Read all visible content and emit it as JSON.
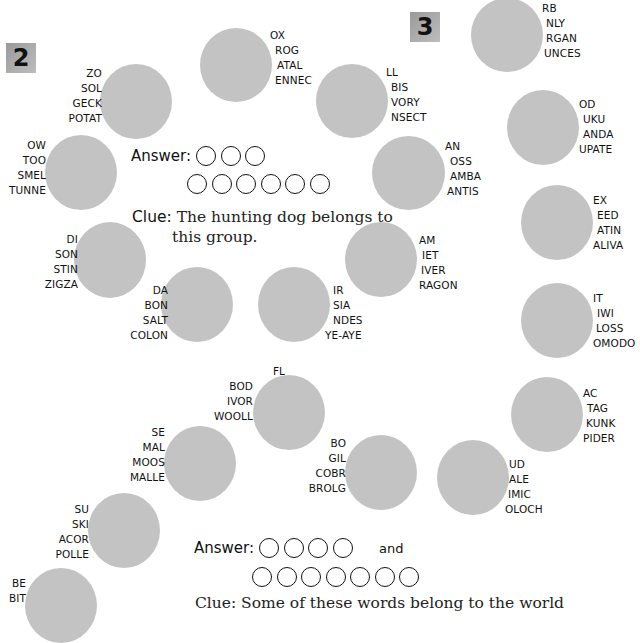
{
  "puzzles": [
    {
      "number": "2",
      "answer_label": "Answer:",
      "answer_rows": [
        3,
        6
      ],
      "clue_label": "Clue:",
      "clue_text_line1": "The hunting dog belongs to",
      "clue_text_line2": "this group.",
      "discs": [
        {
          "id": "ox",
          "words": [
            "OX",
            "ROG",
            "ATAL",
            "ENNEC"
          ],
          "side": "right"
        },
        {
          "id": "ll",
          "words": [
            "LL",
            "BIS",
            "VORY",
            "NSECT"
          ],
          "side": "right"
        },
        {
          "id": "zo",
          "words": [
            "ZO",
            "SOL",
            "GECK",
            "POTAT"
          ],
          "side": "left"
        },
        {
          "id": "ow",
          "words": [
            "OW",
            "TOO",
            "SMEL",
            "TUNNE"
          ],
          "side": "left"
        },
        {
          "id": "an",
          "words": [
            "AN",
            "OSS",
            "AMBA",
            "ANTIS"
          ],
          "side": "right"
        },
        {
          "id": "di",
          "words": [
            "DI",
            "SON",
            "STIN",
            "ZIGZA"
          ],
          "side": "left"
        },
        {
          "id": "am",
          "words": [
            "AM",
            "IET",
            "IVER",
            "RAGON"
          ],
          "side": "right"
        },
        {
          "id": "da",
          "words": [
            "DA",
            "BON",
            "SALT",
            "COLON"
          ],
          "side": "left"
        },
        {
          "id": "ir",
          "words": [
            "IR",
            "SIA",
            "NDES",
            "YE-AYE"
          ],
          "side": "right"
        }
      ]
    },
    {
      "number": "3",
      "answer_label": "Answer:",
      "answer_rows": [
        4,
        7
      ],
      "answer_joiner": "and",
      "clue_partial": "Clue: Some of these words belong to the world",
      "discs": [
        {
          "id": "rb",
          "words": [
            "RB",
            "NLY",
            "RGAN",
            "UNCES"
          ],
          "side": "right"
        },
        {
          "id": "od",
          "words": [
            "OD",
            "UKU",
            "ANDA",
            "UPATE"
          ],
          "side": "right"
        },
        {
          "id": "ex",
          "words": [
            "EX",
            "EED",
            "ATIN",
            "ALIVA"
          ],
          "side": "right"
        },
        {
          "id": "it",
          "words": [
            "IT",
            "IWI",
            "LOSS",
            "OMODO"
          ],
          "side": "right"
        },
        {
          "id": "ac",
          "words": [
            "AC",
            "TAG",
            "KUNK",
            "PIDER"
          ],
          "side": "right"
        },
        {
          "id": "fl",
          "words": [
            "FL",
            "BOD",
            "IVOR",
            "WOOLL"
          ],
          "side": "left"
        },
        {
          "id": "se",
          "words": [
            "SE",
            "MAL",
            "MOOS",
            "MALLE"
          ],
          "side": "left"
        },
        {
          "id": "bo",
          "words": [
            "BO",
            "GIL",
            "COBR",
            "BROLG"
          ],
          "side": "left"
        },
        {
          "id": "ud",
          "words": [
            "UD",
            "ALE",
            "IMIC",
            "OLOCH"
          ],
          "side": "right"
        },
        {
          "id": "su",
          "words": [
            "SU",
            "SKI",
            "ACOR",
            "POLLE"
          ],
          "side": "left"
        },
        {
          "id": "be",
          "words": [
            "BE",
            "BIT"
          ],
          "side": "left"
        }
      ]
    }
  ],
  "colors": {
    "disc": "#c3c3c3",
    "badge": "#a8a8a8",
    "text": "#111111"
  }
}
